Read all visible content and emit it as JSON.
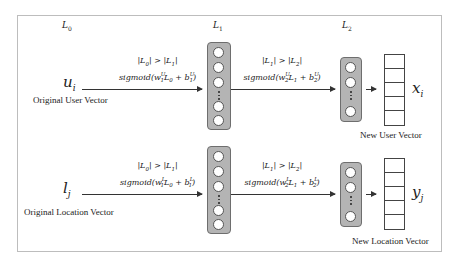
{
  "layers": {
    "l0": {
      "base": "L",
      "sub": "0"
    },
    "l1": {
      "base": "L",
      "sub": "1"
    },
    "l2": {
      "base": "L",
      "sub": "2"
    }
  },
  "user_branch": {
    "input_var": {
      "base": "u",
      "sub": "i"
    },
    "input_caption": "Original User Vector",
    "transform1": {
      "size_constraint": "|L0| > |L1|",
      "activation": "sigmoid",
      "weight": "w",
      "weight_sub": "1",
      "weight_sup": "U",
      "input": "L",
      "input_sub": "0",
      "bias": "b",
      "bias_sub": "1",
      "bias_sup": "U"
    },
    "transform2": {
      "size_constraint": "|L1| > |L2|",
      "activation": "sigmoid",
      "weight": "w",
      "weight_sub": "2",
      "weight_sup": "U",
      "input": "L",
      "input_sub": "1",
      "bias": "b",
      "bias_sub": "2",
      "bias_sup": "U"
    },
    "output_var": {
      "base": "x",
      "sub": "i"
    },
    "output_caption": "New User Vector"
  },
  "location_branch": {
    "input_var": {
      "base": "l",
      "sub": "j"
    },
    "input_caption": "Original Location Vector",
    "transform1": {
      "size_constraint": "|L0| > |L1|",
      "activation": "sigmoid",
      "weight": "w",
      "weight_sub": "1",
      "weight_sup": "L",
      "input": "L",
      "input_sub": "0",
      "bias": "b",
      "bias_sub": "1",
      "bias_sup": "L"
    },
    "transform2": {
      "size_constraint": "|L1| > |L2|",
      "activation": "sigmoid",
      "weight": "w",
      "weight_sub": "2",
      "weight_sup": "L",
      "input": "L",
      "input_sub": "1",
      "bias": "b",
      "bias_sub": "2",
      "bias_sup": "L"
    },
    "output_var": {
      "base": "y",
      "sub": "j"
    },
    "output_caption": "New Location Vector"
  },
  "colors": {
    "layer_fill": "#b4b4b4",
    "layer_border": "#6e6e6e",
    "frame_border": "#bdbdbd"
  }
}
